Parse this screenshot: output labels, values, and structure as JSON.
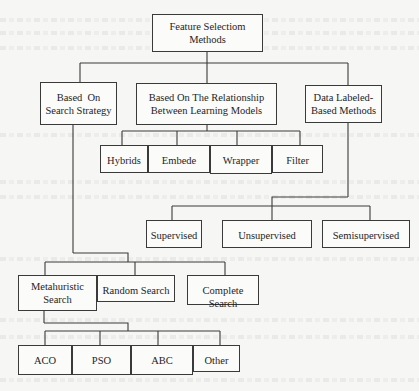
{
  "diagram": {
    "type": "tree",
    "root": {
      "id": "root",
      "label": "Feature Selectiom Methods"
    },
    "nodes": [
      {
        "id": "root",
        "label": "Feature Selectiom\nMethods",
        "parent": null
      },
      {
        "id": "search-strategy",
        "label": "Based  On\nSearch Strategy",
        "parent": "root"
      },
      {
        "id": "relationship",
        "label": "Based On The Relationship\nBetween Learning Models",
        "parent": "root"
      },
      {
        "id": "data-labeled",
        "label": "Data Labeled-\nBased Methods",
        "parent": "root"
      },
      {
        "id": "hybrids",
        "label": "Hybrids",
        "parent": "relationship"
      },
      {
        "id": "embede",
        "label": "Embede",
        "parent": "relationship"
      },
      {
        "id": "wrapper",
        "label": "Wrapper",
        "parent": "relationship"
      },
      {
        "id": "filter",
        "label": "Filter",
        "parent": "relationship"
      },
      {
        "id": "supervised",
        "label": "Supervised",
        "parent": "data-labeled"
      },
      {
        "id": "unsupervised",
        "label": "Unsupervised",
        "parent": "data-labeled"
      },
      {
        "id": "semisupervised",
        "label": "Semisupervised",
        "parent": "data-labeled"
      },
      {
        "id": "metaheuristic",
        "label": "Metahuristic\nSearch",
        "parent": "search-strategy"
      },
      {
        "id": "random",
        "label": "Random Search",
        "parent": "search-strategy"
      },
      {
        "id": "complete",
        "label": "Complete Search",
        "parent": "search-strategy"
      },
      {
        "id": "aco",
        "label": "ACO",
        "parent": "metaheuristic"
      },
      {
        "id": "pso",
        "label": "PSO",
        "parent": "metaheuristic"
      },
      {
        "id": "abc",
        "label": "ABC",
        "parent": "metaheuristic"
      },
      {
        "id": "other",
        "label": "Other",
        "parent": "metaheuristic"
      }
    ]
  },
  "labels": {
    "root": "Feature Selectiom",
    "root2": "Methods",
    "search_strategy1": "Based  On",
    "search_strategy2": "Search Strategy",
    "relationship1": "Based On The Relationship",
    "relationship2": "Between Learning Models",
    "data_labeled1": "Data Labeled-",
    "data_labeled2": "Based Methods",
    "hybrids": "Hybrids",
    "embede": "Embede",
    "wrapper": "Wrapper",
    "filter": "Filter",
    "supervised": "Supervised",
    "unsupervised": "Unsupervised",
    "semisupervised": "Semisupervised",
    "metaheuristic1": "Metahuristic",
    "metaheuristic2": "Search",
    "random": "Random Search",
    "complete": "Complete Search",
    "aco": "ACO",
    "pso": "PSO",
    "abc": "ABC",
    "other": "Other"
  },
  "colors": {
    "line": "#3a3a3a",
    "box_border": "#3a3a3a",
    "background": "#f6f6f4"
  }
}
